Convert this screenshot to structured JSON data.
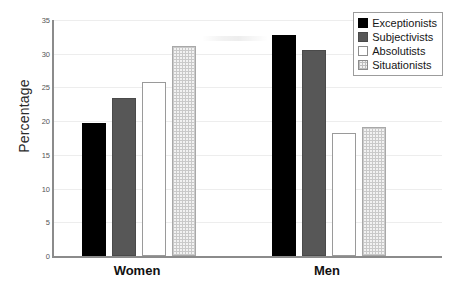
{
  "chart_data": {
    "type": "bar",
    "title": "",
    "xlabel": "",
    "ylabel": "Percentage",
    "ylim": [
      0,
      35
    ],
    "ytick_labels": [
      "0",
      "5",
      "10",
      "15",
      "20",
      "25",
      "30",
      "35"
    ],
    "ytick_values": [
      0,
      5,
      10,
      15,
      20,
      25,
      30,
      35
    ],
    "grid": true,
    "legend_position": "top-right",
    "categories": [
      "Women",
      "Men"
    ],
    "series": [
      {
        "name": "Exceptionists",
        "color": "#000000",
        "fill": "solid-black",
        "values": [
          19.7,
          32.8
        ]
      },
      {
        "name": "Subjectivists",
        "color": "#575757",
        "fill": "solid-gray",
        "values": [
          23.5,
          30.5
        ]
      },
      {
        "name": "Absolutists",
        "color": "#ffffff",
        "fill": "white-outline",
        "values": [
          25.8,
          18.3
        ]
      },
      {
        "name": "Situationists",
        "color": "#f2f2f2",
        "fill": "dotted-light",
        "values": [
          31.2,
          19.2
        ]
      }
    ]
  },
  "axis": {
    "y_title": "Percentage"
  },
  "legend": {
    "items": [
      {
        "label": "Exceptionists"
      },
      {
        "label": "Subjectivists"
      },
      {
        "label": "Absolutists"
      },
      {
        "label": "Situationists"
      }
    ]
  }
}
